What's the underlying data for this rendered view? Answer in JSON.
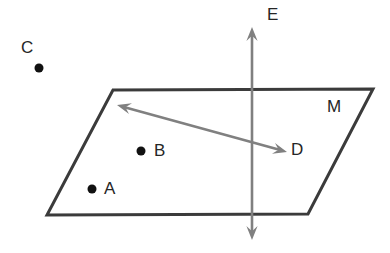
{
  "diagram": {
    "type": "geometry-plane-points-line",
    "canvas": {
      "width": 390,
      "height": 253,
      "background": "#ffffff"
    },
    "colors": {
      "plane_edge": "#3b3b3b",
      "line_gray": "#808080",
      "point_fill": "#111111",
      "label_text": "#262626"
    },
    "plane": {
      "name_label": "M",
      "stroke_width": 3,
      "vertices": [
        {
          "x": 113,
          "y": 90
        },
        {
          "x": 373,
          "y": 89
        },
        {
          "x": 308,
          "y": 214
        },
        {
          "x": 47,
          "y": 215
        }
      ]
    },
    "points": [
      {
        "id": "C",
        "label": "C",
        "cx": 39,
        "cy": 68,
        "r": 4.5,
        "label_x": 21,
        "label_y": 39,
        "in_plane": false
      },
      {
        "id": "B",
        "label": "B",
        "cx": 141,
        "cy": 151,
        "r": 4.5,
        "label_x": 154,
        "label_y": 142,
        "in_plane": true
      },
      {
        "id": "A",
        "label": "A",
        "cx": 92,
        "cy": 189,
        "r": 4.5,
        "label_x": 104,
        "label_y": 180,
        "in_plane": true
      }
    ],
    "lines": [
      {
        "id": "E",
        "label": "E",
        "label_x": 267,
        "label_y": 6,
        "orientation": "vertical",
        "double_arrow": true,
        "stroke_width": 2.6,
        "from": {
          "x": 252,
          "y": 27
        },
        "to": {
          "x": 252,
          "y": 240
        }
      },
      {
        "id": "D",
        "label": "D",
        "label_x": 291,
        "label_y": 141,
        "orientation": "diagonal-in-plane",
        "double_arrow": true,
        "stroke_width": 2.6,
        "from": {
          "x": 117,
          "y": 105
        },
        "to": {
          "x": 287,
          "y": 152
        }
      }
    ],
    "label_font_size_px": 17
  }
}
